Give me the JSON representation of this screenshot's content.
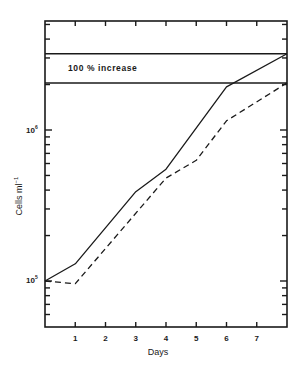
{
  "chart_data": {
    "type": "line",
    "title": "",
    "xlabel": "Days",
    "ylabel": "Cells ml⁻¹",
    "yscale": "log",
    "xlim": [
      0,
      8
    ],
    "ylim": [
      50000,
      5300000
    ],
    "grid": false,
    "legend": null,
    "x_ticks": [
      1,
      2,
      3,
      4,
      5,
      6,
      7
    ],
    "x_tick_labels": [
      "1",
      "2",
      "3",
      "4",
      "5",
      "6",
      "7"
    ],
    "y_tick_labels": [
      {
        "value": 100000,
        "label": "10",
        "exp": "5"
      },
      {
        "value": 1000000,
        "label": "10",
        "exp": "6"
      }
    ],
    "series": [
      {
        "name": "solid",
        "style": "solid",
        "points": [
          [
            0,
            100000
          ],
          [
            1,
            130000
          ],
          [
            3,
            390000
          ],
          [
            4,
            550000
          ],
          [
            6,
            1930000
          ],
          [
            8,
            3200000
          ]
        ]
      },
      {
        "name": "dashed",
        "style": "dashed",
        "points": [
          [
            0,
            100000
          ],
          [
            1,
            96000
          ],
          [
            4,
            480000
          ],
          [
            5,
            630000
          ],
          [
            6,
            1150000
          ],
          [
            8,
            2050000
          ]
        ]
      }
    ],
    "reference_lines": [
      {
        "orientation": "horizontal",
        "y": 3200000
      },
      {
        "orientation": "horizontal",
        "y": 2050000
      }
    ],
    "annotations": [
      {
        "text": "100 % increase",
        "between_reference_lines": true
      }
    ]
  },
  "labels": {
    "xlabel": "Days",
    "ylabel": "Cells ml",
    "ylabel_sup": "−1",
    "annotation": "100 % increase",
    "y5_base": "10",
    "y5_exp": "5",
    "y6_base": "10",
    "y6_exp": "6"
  }
}
